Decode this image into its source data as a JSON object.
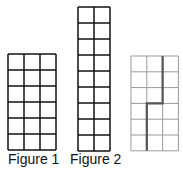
{
  "figures": [
    {
      "label": "Figure 1",
      "cols": 3,
      "rows": 6,
      "x": 8,
      "y": 54,
      "cell": 16,
      "stroke": "#111111"
    },
    {
      "label": "Figure 2",
      "cols": 2,
      "rows": 9,
      "x": 78,
      "y": 7,
      "cell": 16,
      "stroke": "#111111"
    },
    {
      "label": "",
      "cols": 3,
      "rows": 6,
      "x": 131,
      "y": 56,
      "cell": 15.8,
      "stroke": "#9a9a9a",
      "cut_path": {
        "color": "#555555",
        "description": "cut line from top at column boundary 2 down 3 rows, left 1 column, then down to bottom"
      }
    }
  ]
}
